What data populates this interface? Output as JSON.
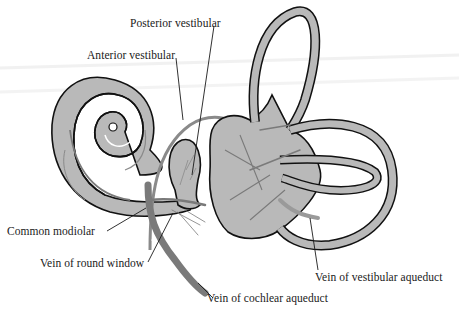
{
  "diagram": {
    "colors": {
      "background": "#ffffff",
      "tissue_fill": "#b9b9b9",
      "outline": "#111111",
      "vein": "#7a7a7a",
      "leader_line": "#1a1a1a",
      "label_text": "#1a1a1a"
    },
    "labels": [
      {
        "id": "posterior-vestibular",
        "text": "Posterior vestibular",
        "x": 130,
        "y": 18
      },
      {
        "id": "anterior-vestibular",
        "text": "Anterior vestibular",
        "x": 87,
        "y": 50
      },
      {
        "id": "common-modiolar",
        "text": "Common modiolar",
        "x": 7,
        "y": 232
      },
      {
        "id": "vein-of-round-window",
        "text": "Vein of round window",
        "x": 40,
        "y": 263
      },
      {
        "id": "vein-of-vestibular-aqueduct",
        "text": "Vein of vestibular aqueduct",
        "x": 315,
        "y": 277
      },
      {
        "id": "vein-of-cochlear-aqueduct",
        "text": "Vein of cochlear aqueduct",
        "x": 207,
        "y": 298
      }
    ],
    "structures": [
      "cochlea",
      "vestibule",
      "saccule",
      "superior semicircular canal",
      "posterior semicircular canal",
      "lateral semicircular canal"
    ]
  }
}
